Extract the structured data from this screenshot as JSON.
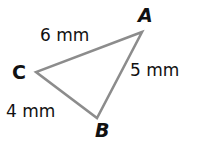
{
  "figure": {
    "type": "triangle",
    "stroke_color": "#8c8c8c",
    "vertices": [
      {
        "label": "A",
        "x": 142,
        "y": 32,
        "label_x": 138,
        "label_y": 22,
        "italic": true
      },
      {
        "label": "C",
        "x": 36,
        "y": 72,
        "label_x": 12,
        "label_y": 79,
        "italic": false
      },
      {
        "label": "B",
        "x": 97,
        "y": 118,
        "label_x": 95,
        "label_y": 137,
        "italic": true
      }
    ],
    "sides": [
      {
        "name": "CA",
        "label": "6 mm",
        "label_x": 40,
        "label_y": 41
      },
      {
        "name": "AB",
        "label": "5 mm",
        "label_x": 130,
        "label_y": 76
      },
      {
        "name": "CB",
        "label": "4 mm",
        "label_x": 6,
        "label_y": 117
      }
    ]
  }
}
